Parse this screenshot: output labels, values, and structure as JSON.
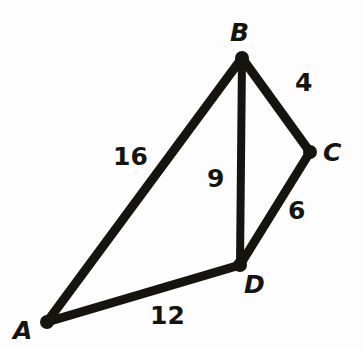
{
  "figure": {
    "type": "geometry-diagram",
    "stroke_color": "#16140f",
    "background_color": "#fdfdfd",
    "vertices": [
      {
        "id": "A",
        "label": "A",
        "x": 47,
        "y": 322
      },
      {
        "id": "B",
        "label": "B",
        "x": 242,
        "y": 58
      },
      {
        "id": "C",
        "label": "C",
        "x": 310,
        "y": 152
      },
      {
        "id": "D",
        "label": "D",
        "x": 240,
        "y": 265
      }
    ],
    "edges": [
      {
        "id": "AB",
        "from": "A",
        "to": "B",
        "length_label": "16"
      },
      {
        "id": "BC",
        "from": "B",
        "to": "C",
        "length_label": "4"
      },
      {
        "id": "CD",
        "from": "C",
        "to": "D",
        "length_label": "6"
      },
      {
        "id": "BD",
        "from": "B",
        "to": "D",
        "length_label": "9"
      },
      {
        "id": "AD",
        "from": "A",
        "to": "D",
        "length_label": "12"
      }
    ],
    "edge_labels": {
      "AB": "16",
      "BD": "9",
      "BC": "4",
      "CD": "6",
      "AD": "12"
    },
    "vertex_labels": {
      "A": "A",
      "B": "B",
      "C": "C",
      "D": "D"
    }
  }
}
